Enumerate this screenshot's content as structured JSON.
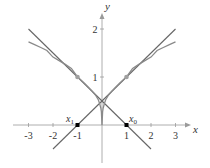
{
  "figure": {
    "type": "diagram",
    "axes": {
      "x_label": "x",
      "y_label": "y",
      "x_ticks": [
        "-3",
        "-2",
        "-1",
        "1",
        "2",
        "3"
      ],
      "y_ticks": [
        "1",
        "2"
      ],
      "x_range": [
        -3.6,
        3.6
      ],
      "y_range": [
        -1.6,
        2.4
      ]
    },
    "curve": {
      "equation": "y = sqrt(|x|)",
      "domain": [
        -3,
        3
      ],
      "color": "#808080"
    },
    "tangent_lines": [
      {
        "name": "tangent-at-1",
        "through": [
          1,
          1
        ],
        "slope": 0.5,
        "x_intercept": -1,
        "from": [
          -2,
          -0.5
        ],
        "to": [
          3,
          2
        ]
      },
      {
        "name": "tangent-at-minus-1",
        "through": [
          -1,
          1
        ],
        "slope": -0.5,
        "x_intercept": 1,
        "from": [
          -3,
          2
        ],
        "to": [
          2,
          -0.5
        ]
      }
    ],
    "points": {
      "tangent_points": [
        [
          -1,
          1
        ],
        [
          1,
          1
        ]
      ],
      "x1": {
        "label": "x",
        "sub": "1",
        "coords": [
          -1,
          0
        ]
      },
      "x0": {
        "label": "x",
        "sub": "0",
        "coords": [
          1,
          0
        ]
      }
    },
    "colors": {
      "line": "#666666",
      "curve": "#8a8a8a",
      "axis": "#999999",
      "tangent_point": "#a0a0a0",
      "intercept_point": "#000000"
    }
  }
}
